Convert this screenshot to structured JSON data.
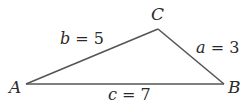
{
  "diagram": {
    "type": "triangle",
    "vertices": [
      {
        "id": "A",
        "label": "A"
      },
      {
        "id": "B",
        "label": "B"
      },
      {
        "id": "C",
        "label": "C"
      }
    ],
    "sides": [
      {
        "id": "a",
        "between": [
          "B",
          "C"
        ],
        "variable": "a",
        "equals": " = ",
        "value": "3"
      },
      {
        "id": "b",
        "between": [
          "A",
          "C"
        ],
        "variable": "b",
        "equals": " = ",
        "value": "5"
      },
      {
        "id": "c",
        "between": [
          "A",
          "B"
        ],
        "variable": "c",
        "equals": " = ",
        "value": "7"
      }
    ],
    "line_color": "#555555",
    "text_color": "#2a2a2a"
  }
}
